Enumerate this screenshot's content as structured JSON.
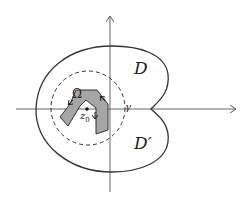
{
  "diagram": {
    "type": "complex-plane-region",
    "labels": {
      "region_upper": "D",
      "region_lower": "D′",
      "inner_region": "Ω",
      "point": "z",
      "point_subscript": "0",
      "curve": "γ"
    },
    "colors": {
      "stroke": "#333333",
      "fill_polygon": "#a6a6a6",
      "axes": "#555555"
    },
    "elements": [
      "x-axis with arrow",
      "y-axis with arrow",
      "outer closed curve (heart-shaped) with cusp on positive real axis",
      "dashed circle γ centered near z0",
      "shaded polygon Ω with orientation arrows",
      "point z0"
    ]
  }
}
